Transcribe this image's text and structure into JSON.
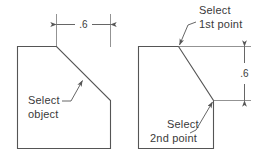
{
  "figure": {
    "title_visible": false,
    "line_color": "#555555",
    "text_color": "#3a3a3a",
    "background": "#ffffff"
  },
  "left_figure": {
    "name": "chamfer-select-object-diagram",
    "dimension": {
      "label": ".6",
      "orientation": "horizontal",
      "position": "top"
    },
    "callout": {
      "line1": "Select",
      "line2": "object"
    }
  },
  "right_figure": {
    "name": "chamfer-select-points-diagram",
    "dimension": {
      "label": ".6",
      "orientation": "vertical",
      "position": "right"
    },
    "callout_first": {
      "line1": "Select",
      "line2": "1st point"
    },
    "callout_second": {
      "line1": "Select",
      "line2": "2nd point"
    }
  }
}
